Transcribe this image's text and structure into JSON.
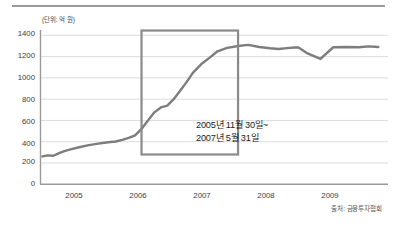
{
  "figure": {
    "unit_label": "(단위: 억 원)",
    "source_note": "출처: 금융투자협회",
    "annotation_line1": "2005년 11월 30일~",
    "annotation_line2": "2007년 5월 31일",
    "line_color": "#7d7d7d",
    "box_color": "#8a8a8a",
    "grid_color": "#d8d8d8",
    "axis_color": "#9a9a9a",
    "text_color": "#3c3c3c"
  },
  "chart_data": {
    "type": "line",
    "title": "",
    "subtitle": "",
    "xlabel": "",
    "ylabel": "(단위: 억 원)",
    "xlim": [
      2004.35,
      2009.75
    ],
    "ylim": [
      0,
      1450
    ],
    "yticks": [
      0,
      200,
      400,
      600,
      800,
      1000,
      1200,
      1400
    ],
    "ytick_labels": [
      "0",
      "200",
      "400",
      "600",
      "800",
      "1000",
      "1200",
      "1400"
    ],
    "xticks": [
      2005,
      2006,
      2007,
      2008,
      2009
    ],
    "xtick_labels": [
      "2005",
      "2006",
      "2007",
      "2008",
      "2009"
    ],
    "grid": "horizontal",
    "legend": "none",
    "series": [
      {
        "name": "펀드 설정액",
        "color": "#7d7d7d",
        "x": [
          2004.38,
          2004.46,
          2004.55,
          2004.63,
          2004.72,
          2004.83,
          2004.95,
          2005.1,
          2005.25,
          2005.4,
          2005.52,
          2005.62,
          2005.72,
          2005.82,
          2005.92,
          2006.02,
          2006.12,
          2006.22,
          2006.32,
          2006.42,
          2006.52,
          2006.62,
          2006.72,
          2006.85,
          2006.98,
          2007.1,
          2007.25,
          2007.42,
          2007.58,
          2007.75,
          2007.92,
          2008.05,
          2008.18,
          2008.3,
          2008.36,
          2008.5,
          2008.7,
          2008.9,
          2009.1,
          2009.3,
          2009.45,
          2009.6
        ],
        "y": [
          262,
          272,
          268,
          290,
          312,
          330,
          348,
          368,
          382,
          395,
          402,
          418,
          436,
          460,
          520,
          600,
          676,
          722,
          740,
          800,
          880,
          960,
          1050,
          1130,
          1190,
          1250,
          1282,
          1300,
          1310,
          1290,
          1278,
          1272,
          1280,
          1286,
          1286,
          1230,
          1178,
          1288,
          1290,
          1288,
          1296,
          1290
        ]
      }
    ],
    "annotations": [
      {
        "type": "highlight-box",
        "label": "2005년 11월 30일~\n2007년 5월 31일",
        "x_start": 2005.92,
        "x_end": 2007.42,
        "y_start": 280,
        "y_end": 1445
      }
    ]
  }
}
